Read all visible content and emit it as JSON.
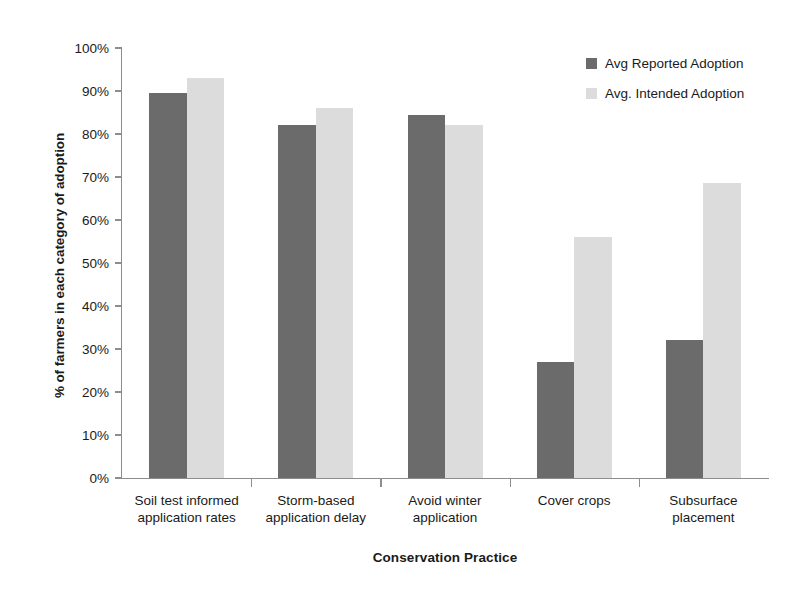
{
  "chart_data": {
    "type": "bar",
    "title": "",
    "xlabel": "Conservation Practice",
    "ylabel": "% of farmers in each category of adoption",
    "ylim": [
      0,
      100
    ],
    "ytick_labels": [
      "0%",
      "10%",
      "20%",
      "30%",
      "40%",
      "50%",
      "60%",
      "70%",
      "80%",
      "90%",
      "100%"
    ],
    "ytick_values": [
      0,
      10,
      20,
      30,
      40,
      50,
      60,
      70,
      80,
      90,
      100
    ],
    "grid": false,
    "legend_position": "top-right",
    "categories": [
      "Soil test informed application rates",
      "Storm-based application delay",
      "Avoid winter application",
      "Cover crops",
      "Subsurface placement"
    ],
    "category_lines": [
      [
        "Soil test informed",
        "application rates"
      ],
      [
        "Storm-based",
        "application delay"
      ],
      [
        "Avoid winter",
        "application"
      ],
      [
        "Cover crops"
      ],
      [
        "Subsurface",
        "placement"
      ]
    ],
    "series": [
      {
        "name": "Avg Reported Adoption",
        "color": "#6b6b6b",
        "values": [
          89.5,
          82,
          84.5,
          27,
          32
        ]
      },
      {
        "name": "Avg. Intended Adoption",
        "color": "#dcdcdc",
        "values": [
          93,
          86,
          82,
          56,
          68.5
        ]
      }
    ]
  },
  "colors": {
    "reported": "#6b6b6b",
    "intended": "#dcdcdc",
    "axis": "#8d8d8d",
    "text": "#1a1a1a",
    "background": "#ffffff"
  }
}
